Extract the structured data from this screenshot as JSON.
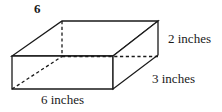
{
  "figure": {
    "problem_number": "6",
    "shape_name": "rectangular-prism",
    "stroke_color": "#1a1a1a",
    "fill_color": "#ffffff",
    "labels": {
      "height": "2 inches",
      "depth": "3 inches",
      "width": "6 inches"
    },
    "dimensions": {
      "height_value": "2",
      "depth_value": "3",
      "width_value": "6",
      "unit": "inches"
    }
  }
}
